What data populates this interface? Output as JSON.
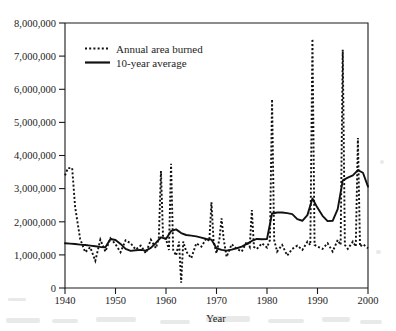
{
  "chart_data": {
    "type": "line",
    "title": "",
    "xlabel": "Year",
    "ylabel": "",
    "xlim": [
      1940,
      2000
    ],
    "ylim": [
      0,
      8000000
    ],
    "grid": false,
    "legend_position": "top-left",
    "x_ticks": [
      "1940",
      "1950",
      "1960",
      "1970",
      "1980",
      "1990",
      "2000"
    ],
    "x_tick_values": [
      1940,
      1950,
      1960,
      1970,
      1980,
      1990,
      2000
    ],
    "y_ticks": [
      "0",
      "1,000,000",
      "2,000,000",
      "3,000,000",
      "4,000,000",
      "5,000,000",
      "6,000,000",
      "7,000,000",
      "8,000,000"
    ],
    "y_tick_values": [
      0,
      1000000,
      2000000,
      3000000,
      4000000,
      5000000,
      6000000,
      7000000,
      8000000
    ],
    "x": [
      1940,
      1941,
      1942,
      1943,
      1944,
      1945,
      1946,
      1947,
      1948,
      1949,
      1950,
      1951,
      1952,
      1953,
      1954,
      1955,
      1956,
      1957,
      1958,
      1959,
      1960,
      1961,
      1962,
      1963,
      1964,
      1965,
      1966,
      1967,
      1968,
      1969,
      1970,
      1971,
      1972,
      1973,
      1974,
      1975,
      1976,
      1977,
      1978,
      1979,
      1980,
      1981,
      1982,
      1983,
      1984,
      1985,
      1986,
      1987,
      1988,
      1989,
      1990,
      1991,
      1992,
      1993,
      1994,
      1995,
      1996,
      1997,
      1998,
      1999,
      2000
    ],
    "series": [
      {
        "name": "Annual area burned",
        "style": "dotted",
        "values": [
          3400000,
          3620000,
          2450000,
          1480000,
          1080000,
          1230000,
          820000,
          1460000,
          1100000,
          1500000,
          1320000,
          1080000,
          1440000,
          1350000,
          1160000,
          1280000,
          1050000,
          1460000,
          1200000,
          1520000,
          1480000,
          1150000,
          980000,
          1400000,
          1100000,
          900000,
          1350000,
          1250000,
          1500000,
          1420000,
          1050000,
          1480000,
          940000,
          1320000,
          1180000,
          1100000,
          1400000,
          1240000,
          1180000,
          1350000,
          1220000,
          1450000,
          1100000,
          1300000,
          980000,
          1180000,
          1280000,
          1150000,
          1400000,
          1300000,
          1250000,
          1180000,
          1350000,
          1100000,
          1450000,
          1300000,
          1180000,
          1400000,
          1250000,
          1320000,
          1200000
        ]
      },
      {
        "name": "10-year average",
        "style": "solid",
        "values": [
          1350000,
          1340000,
          1330000,
          1310000,
          1300000,
          1280000,
          1260000,
          1240000,
          1230000,
          1480000,
          1450000,
          1330000,
          1180000,
          1120000,
          1140000,
          1150000,
          1130000,
          1210000,
          1360000,
          1530000,
          1480000,
          1720000,
          1770000,
          1660000,
          1600000,
          1580000,
          1560000,
          1520000,
          1480000,
          1460000,
          1200000,
          1150000,
          1130000,
          1160000,
          1200000,
          1250000,
          1330000,
          1420000,
          1480000,
          1470000,
          1480000,
          2250000,
          2280000,
          2280000,
          2260000,
          2230000,
          2080000,
          2030000,
          2200000,
          2700000,
          2420000,
          2180000,
          2020000,
          2030000,
          2380000,
          3250000,
          3330000,
          3400000,
          3560000,
          3480000,
          3060000
        ]
      }
    ],
    "legend": [
      {
        "label": "Annual area burned",
        "style": "dotted"
      },
      {
        "label": "10-year average",
        "style": "solid"
      }
    ],
    "annual_peaks": [
      {
        "year": 1941,
        "value": 3620000
      },
      {
        "year": 1959,
        "value": 3530000
      },
      {
        "year": 1961,
        "value": 3750000
      },
      {
        "year": 1963,
        "value": 160000
      },
      {
        "year": 1969,
        "value": 2590000
      },
      {
        "year": 1971,
        "value": 2100000
      },
      {
        "year": 1977,
        "value": 2350000
      },
      {
        "year": 1981,
        "value": 5700000
      },
      {
        "year": 1989,
        "value": 7520000
      },
      {
        "year": 1995,
        "value": 7190000
      },
      {
        "year": 1998,
        "value": 4530000
      }
    ]
  }
}
